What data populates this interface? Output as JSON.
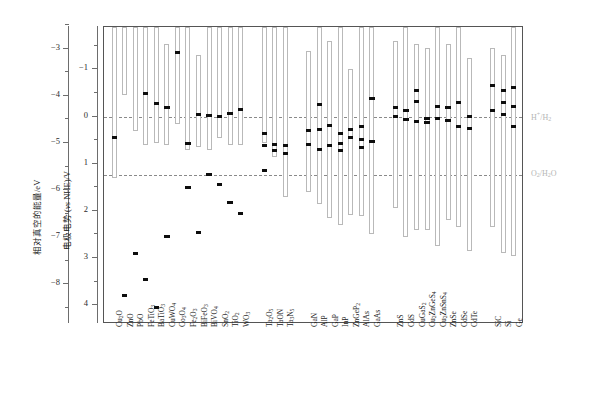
{
  "chart_data": {
    "type": "bar",
    "title": "",
    "subtitle": "",
    "ylabel_left": "相对真空的能量/eV",
    "ylabel_right_axis": "电极电势 (vs NHE)/V",
    "xlabel": "",
    "grid": false,
    "legend_position": "none",
    "axis_vacuum": {
      "label": "相对真空的能量/eV",
      "ticks": [
        -3,
        -4,
        -5,
        -6,
        -7,
        -8
      ],
      "tick_labels": [
        "−3",
        "−4",
        "−5",
        "−6",
        "−7",
        "−8"
      ],
      "range": [
        -2.5,
        -8.6
      ]
    },
    "axis_nhe": {
      "label": "电极电势 (vs NHE)/V",
      "ticks": [
        -1,
        0,
        1,
        2,
        3,
        4
      ],
      "tick_labels": [
        "−1",
        "0",
        "1",
        "2",
        "3",
        "4"
      ],
      "range": [
        -1.9,
        4.4
      ]
    },
    "reference_lines": [
      {
        "name": "H+/H2",
        "label": "H⁺/H₂",
        "value": 0.0
      },
      {
        "name": "O2/H2O",
        "label": "O₂/H₂O",
        "value": 1.23
      }
    ],
    "ylim_nhe": [
      -1.9,
      4.4
    ],
    "note": "Each entry: band bar spans conduction-band minimum (cbm, top) to valence-band maximum (vbm, bottom) on the NHE potential scale; markers are measured/flat-band level ticks.",
    "groups": [
      {
        "name": "oxides",
        "materials": [
          {
            "label": "Cu₂O",
            "cbm": -1.9,
            "vbm": 1.3,
            "markers": [
              0.45
            ]
          },
          {
            "label": "ZnO",
            "cbm": -1.9,
            "vbm": -0.45,
            "markers": [
              3.8
            ]
          },
          {
            "label": "PbO",
            "cbm": -1.9,
            "vbm": 0.3,
            "markers": [
              2.9
            ]
          },
          {
            "label": "FeTiO₃",
            "cbm": -1.9,
            "vbm": 0.6,
            "markers": [
              -0.48,
              3.45
            ]
          },
          {
            "label": "BaTiO₃",
            "cbm": -1.9,
            "vbm": 0.55,
            "markers": [
              -0.27,
              4.05
            ]
          },
          {
            "label": "CuWO₄",
            "cbm": -1.55,
            "vbm": 0.6,
            "markers": [
              -0.2,
              2.55
            ]
          },
          {
            "label": "Co₃O₄",
            "cbm": -1.9,
            "vbm": 0.15,
            "markers": [
              -1.37
            ]
          },
          {
            "label": "Fe₂O₃",
            "cbm": -1.9,
            "vbm": 0.7,
            "markers": [
              0.58,
              1.5
            ]
          },
          {
            "label": "BiFeO₃",
            "cbm": -1.3,
            "vbm": 0.65,
            "markers": [
              -0.05,
              2.45
            ]
          },
          {
            "label": "BiVO₄",
            "cbm": -1.9,
            "vbm": 0.7,
            "markers": [
              -0.02,
              1.23
            ]
          },
          {
            "label": "SnO₂",
            "cbm": -1.9,
            "vbm": 0.45,
            "markers": [
              0.0,
              1.45
            ]
          },
          {
            "label": "TiO₂",
            "cbm": -1.9,
            "vbm": 0.6,
            "markers": [
              -0.07,
              1.82
            ]
          },
          {
            "label": "WO₃",
            "cbm": -1.9,
            "vbm": 0.6,
            "markers": [
              -0.15,
              2.05
            ]
          }
        ]
      },
      {
        "name": "oxynitrides-nitrides",
        "materials": [
          {
            "label": "Ta₂O₅",
            "cbm": -1.9,
            "vbm": 0.55,
            "markers": [
              0.35,
              0.62,
              1.15
            ]
          },
          {
            "label": "TaON",
            "cbm": -1.9,
            "vbm": 0.85,
            "markers": [
              0.6,
              0.72
            ]
          },
          {
            "label": "Ta₃N₅",
            "cbm": -1.9,
            "vbm": 1.7,
            "markers": [
              0.62,
              0.78
            ]
          }
        ]
      },
      {
        "name": "pnictides",
        "materials": [
          {
            "label": "GaN",
            "cbm": -1.4,
            "vbm": 1.6,
            "markers": [
              0.3,
              0.6
            ]
          },
          {
            "label": "AlP",
            "cbm": -1.9,
            "vbm": 1.85,
            "markers": [
              -0.25,
              0.28,
              0.7
            ]
          },
          {
            "label": "GaP",
            "cbm": -1.6,
            "vbm": 2.15,
            "markers": [
              0.18,
              0.62
            ]
          },
          {
            "label": "InP",
            "cbm": -1.9,
            "vbm": 2.3,
            "markers": [
              0.35,
              0.57,
              0.72
            ]
          },
          {
            "label": "ZnGeP₂",
            "cbm": -1.0,
            "vbm": 2.1,
            "markers": [
              0.28,
              0.45
            ]
          },
          {
            "label": "AlAs",
            "cbm": -1.9,
            "vbm": 2.1,
            "markers": [
              0.22,
              0.48,
              0.65
            ]
          },
          {
            "label": "GaAs",
            "cbm": -1.9,
            "vbm": 2.5,
            "markers": [
              -0.38,
              0.52
            ]
          }
        ]
      },
      {
        "name": "chalcogenides",
        "materials": [
          {
            "label": "ZnS",
            "cbm": -1.6,
            "vbm": 1.95,
            "markers": [
              -0.2,
              0.0
            ]
          },
          {
            "label": "CdS",
            "cbm": -1.9,
            "vbm": 2.55,
            "markers": [
              -0.13,
              0.07
            ]
          },
          {
            "label": "CuGaS₂",
            "cbm": -1.55,
            "vbm": 2.4,
            "markers": [
              -0.55,
              -0.32,
              0.1
            ]
          },
          {
            "label": "Cu₂ZnGeS₄",
            "cbm": -1.45,
            "vbm": 2.4,
            "markers": [
              0.03,
              0.12
            ]
          },
          {
            "label": "Cu₂ZnSnS₄",
            "cbm": -1.9,
            "vbm": 2.75,
            "markers": [
              -0.21,
              0.05
            ]
          },
          {
            "label": "ZnSe",
            "cbm": -1.55,
            "vbm": 2.2,
            "markers": [
              -0.2,
              0.08
            ]
          },
          {
            "label": "CdSe",
            "cbm": -1.9,
            "vbm": 2.35,
            "markers": [
              -0.3,
              0.22
            ]
          },
          {
            "label": "CdTe",
            "cbm": -1.25,
            "vbm": 2.85,
            "markers": [
              0.0,
              0.25
            ]
          }
        ]
      },
      {
        "name": "group-iv",
        "materials": [
          {
            "label": "SiC",
            "cbm": -1.45,
            "vbm": 2.35,
            "markers": [
              -0.65,
              -0.13
            ]
          },
          {
            "label": "Si",
            "cbm": -1.3,
            "vbm": 2.9,
            "markers": [
              -0.55,
              -0.3,
              -0.05
            ]
          },
          {
            "label": "Ge",
            "cbm": -1.9,
            "vbm": 2.95,
            "markers": [
              -0.62,
              -0.22,
              0.2
            ]
          }
        ]
      }
    ]
  }
}
